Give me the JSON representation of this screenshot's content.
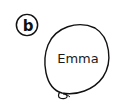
{
  "label": {
    "letter": "b"
  },
  "balloon": {
    "name": "Emma",
    "stroke": "#111111",
    "fill": "#ffffff"
  }
}
